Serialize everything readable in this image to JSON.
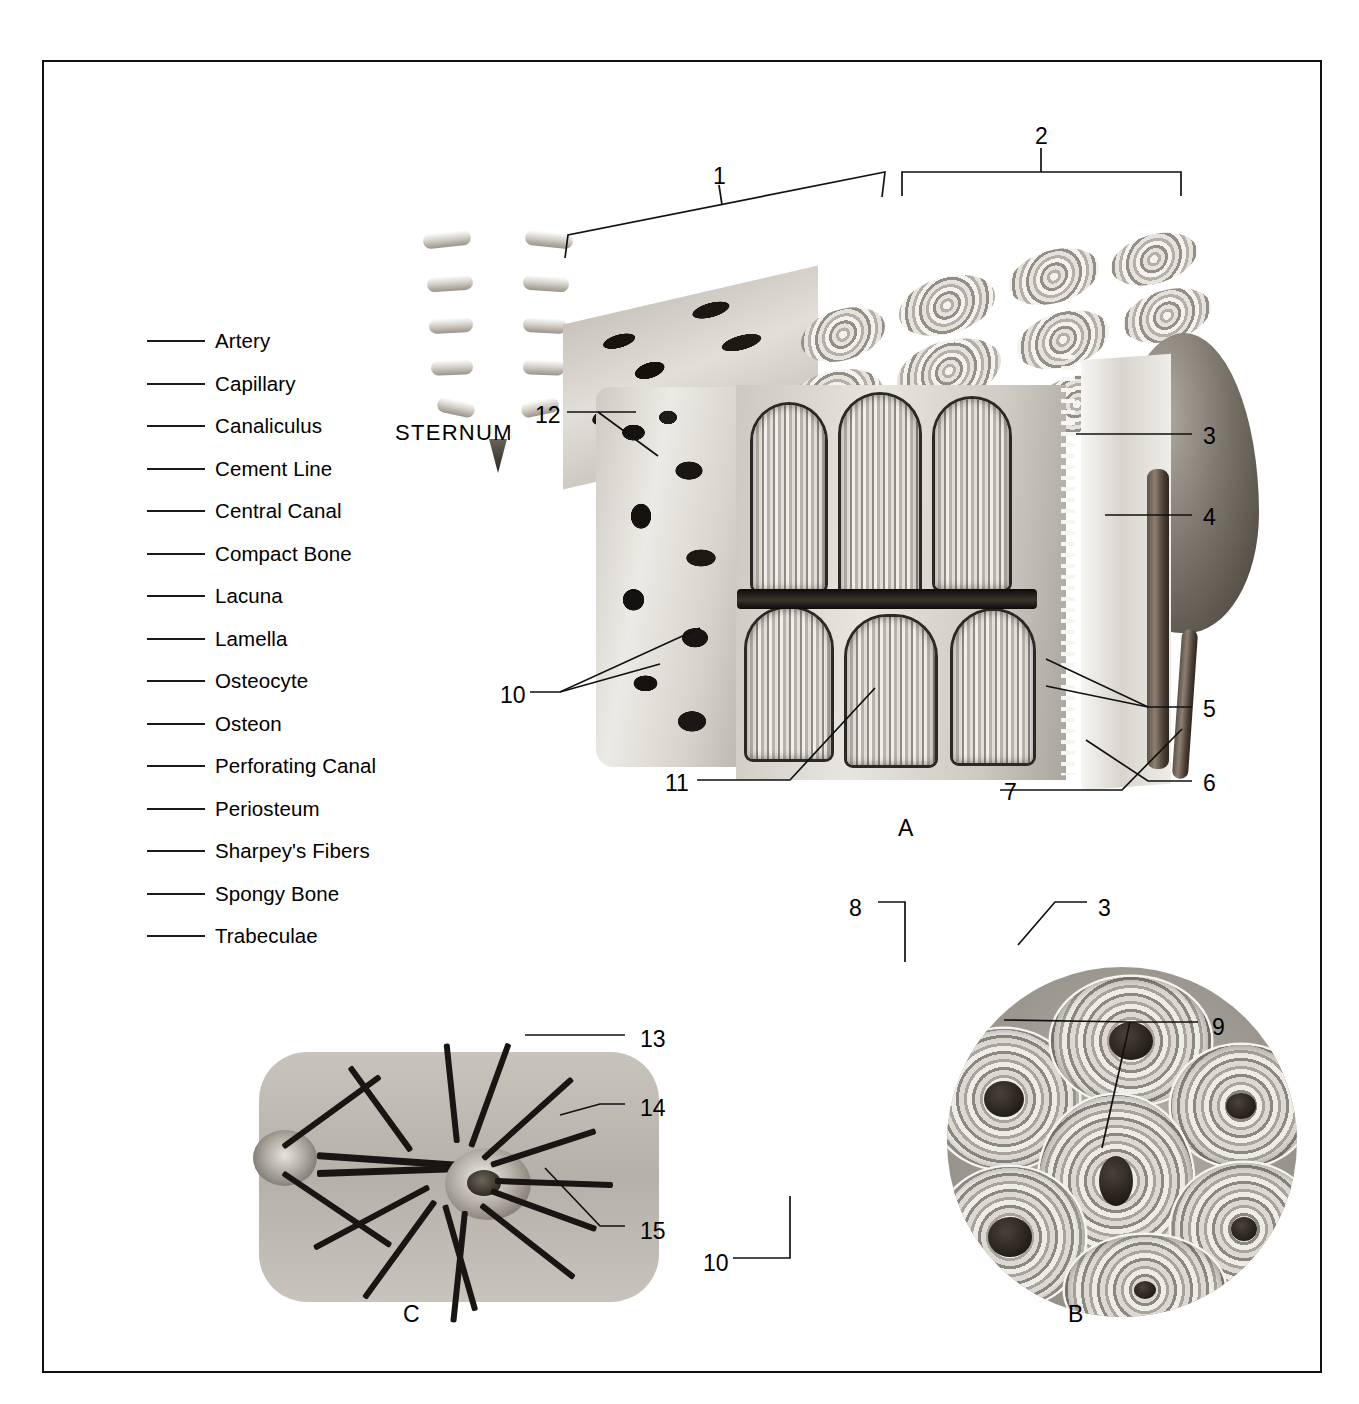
{
  "figure": {
    "word_bank_title": "",
    "word_bank": [
      {
        "id": 1,
        "term": "Artery"
      },
      {
        "id": 2,
        "term": "Capillary"
      },
      {
        "id": 3,
        "term": "Canaliculus"
      },
      {
        "id": 4,
        "term": "Cement Line"
      },
      {
        "id": 5,
        "term": "Central Canal"
      },
      {
        "id": 6,
        "term": "Compact Bone"
      },
      {
        "id": 7,
        "term": "Lacuna"
      },
      {
        "id": 8,
        "term": "Lamella"
      },
      {
        "id": 9,
        "term": "Osteocyte"
      },
      {
        "id": 10,
        "term": "Osteon"
      },
      {
        "id": 11,
        "term": "Perforating Canal"
      },
      {
        "id": 12,
        "term": "Periosteum"
      },
      {
        "id": 13,
        "term": "Sharpey's Fibers"
      },
      {
        "id": 14,
        "term": "Spongy Bone"
      },
      {
        "id": 15,
        "term": "Trabeculae"
      }
    ],
    "sternum_caption": "STERNUM",
    "panel_labels": {
      "a": "A",
      "b": "B",
      "c": "C"
    },
    "callouts": {
      "panel_a": [
        {
          "num": "1",
          "x": 713,
          "y": 165
        },
        {
          "num": "2",
          "x": 1035,
          "y": 125
        },
        {
          "num": "3",
          "x": 1203,
          "y": 425
        },
        {
          "num": "4",
          "x": 1203,
          "y": 506
        },
        {
          "num": "5",
          "x": 1203,
          "y": 698
        },
        {
          "num": "6",
          "x": 1203,
          "y": 772
        },
        {
          "num": "7",
          "x": 1004,
          "y": 781
        },
        {
          "num": "10",
          "x": 500,
          "y": 684
        },
        {
          "num": "11",
          "x": 665,
          "y": 772
        },
        {
          "num": "12",
          "x": 535,
          "y": 404
        }
      ],
      "panel_b": [
        {
          "num": "8",
          "x": 849,
          "y": 897
        },
        {
          "num": "3",
          "x": 1098,
          "y": 897
        },
        {
          "num": "9",
          "x": 1212,
          "y": 1016
        },
        {
          "num": "10",
          "x": 703,
          "y": 1252
        }
      ],
      "panel_c": [
        {
          "num": "13",
          "x": 640,
          "y": 1028
        },
        {
          "num": "14",
          "x": 640,
          "y": 1097
        },
        {
          "num": "15",
          "x": 640,
          "y": 1220
        }
      ]
    }
  },
  "colors": {
    "frame": "#111111",
    "ink": "#000000",
    "paper": "#ffffff",
    "bone_light": "#e8e5df",
    "bone_mid": "#b5b0a7",
    "bone_dark": "#2c2824",
    "vessel": "#5d5147"
  }
}
